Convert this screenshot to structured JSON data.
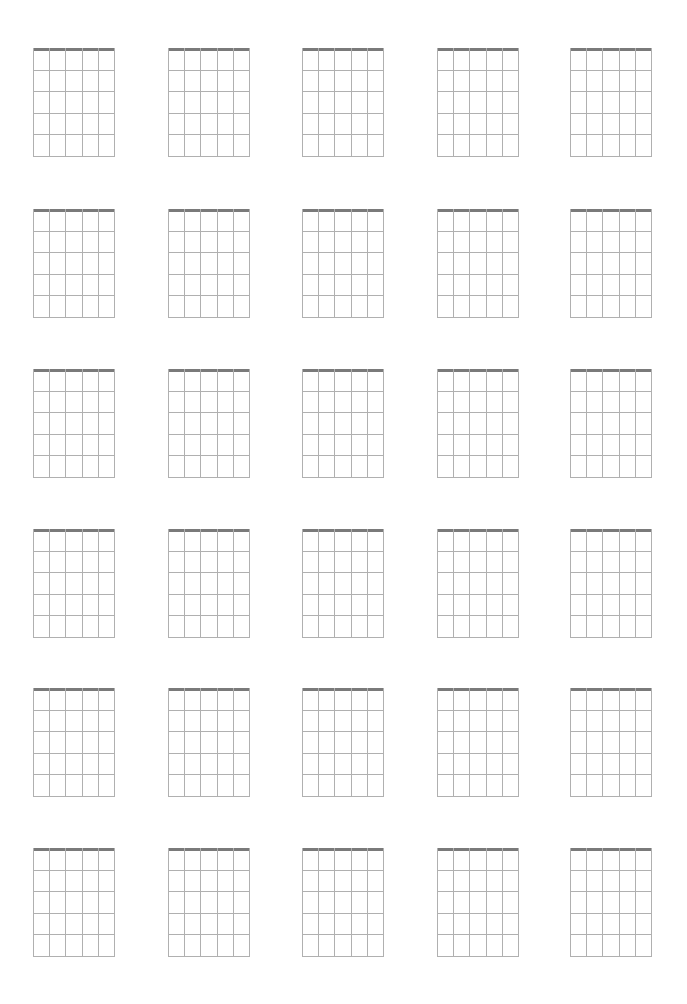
{
  "page": {
    "title": "",
    "layout": {
      "columns": 5,
      "rows": 6
    },
    "colors": {
      "nut": "#7a7a7a",
      "grid_line": "#b0b0b0",
      "background": "#ffffff"
    }
  },
  "chord_diagram": {
    "strings": 6,
    "frets": 5,
    "width": 82,
    "height": 109
  },
  "grid": {
    "column_x": [
      33,
      168,
      302,
      437,
      570
    ],
    "row_y": [
      48,
      209,
      369,
      529,
      688,
      848
    ]
  },
  "diagrams": [
    {
      "row": 1,
      "col": 1,
      "label": ""
    },
    {
      "row": 1,
      "col": 2,
      "label": ""
    },
    {
      "row": 1,
      "col": 3,
      "label": ""
    },
    {
      "row": 1,
      "col": 4,
      "label": ""
    },
    {
      "row": 1,
      "col": 5,
      "label": ""
    },
    {
      "row": 2,
      "col": 1,
      "label": ""
    },
    {
      "row": 2,
      "col": 2,
      "label": ""
    },
    {
      "row": 2,
      "col": 3,
      "label": ""
    },
    {
      "row": 2,
      "col": 4,
      "label": ""
    },
    {
      "row": 2,
      "col": 5,
      "label": ""
    },
    {
      "row": 3,
      "col": 1,
      "label": ""
    },
    {
      "row": 3,
      "col": 2,
      "label": ""
    },
    {
      "row": 3,
      "col": 3,
      "label": ""
    },
    {
      "row": 3,
      "col": 4,
      "label": ""
    },
    {
      "row": 3,
      "col": 5,
      "label": ""
    },
    {
      "row": 4,
      "col": 1,
      "label": ""
    },
    {
      "row": 4,
      "col": 2,
      "label": ""
    },
    {
      "row": 4,
      "col": 3,
      "label": ""
    },
    {
      "row": 4,
      "col": 4,
      "label": ""
    },
    {
      "row": 4,
      "col": 5,
      "label": ""
    },
    {
      "row": 5,
      "col": 1,
      "label": ""
    },
    {
      "row": 5,
      "col": 2,
      "label": ""
    },
    {
      "row": 5,
      "col": 3,
      "label": ""
    },
    {
      "row": 5,
      "col": 4,
      "label": ""
    },
    {
      "row": 5,
      "col": 5,
      "label": ""
    },
    {
      "row": 6,
      "col": 1,
      "label": ""
    },
    {
      "row": 6,
      "col": 2,
      "label": ""
    },
    {
      "row": 6,
      "col": 3,
      "label": ""
    },
    {
      "row": 6,
      "col": 4,
      "label": ""
    },
    {
      "row": 6,
      "col": 5,
      "label": ""
    }
  ]
}
